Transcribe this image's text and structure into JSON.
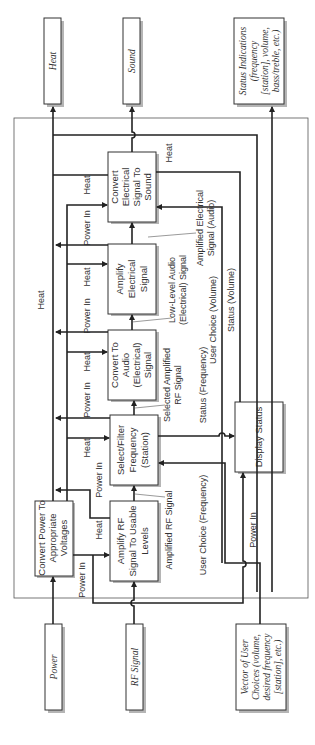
{
  "diagram": {
    "orientation": "rotated-90-ccw",
    "external_outputs": [
      {
        "id": "heat",
        "label": "Heat"
      },
      {
        "id": "sound",
        "label": "Sound"
      },
      {
        "id": "status",
        "lines": [
          "Status Indications",
          "(frequency",
          "[station], volume,",
          "bass/treble, etc.)"
        ]
      }
    ],
    "external_inputs": [
      {
        "id": "power",
        "label": "Power"
      },
      {
        "id": "rf",
        "label": "RF Signal"
      },
      {
        "id": "choices",
        "lines": [
          "Vector of User",
          "Choices (volume,",
          "desired frequency",
          "[station], etc.)"
        ]
      }
    ],
    "functions": [
      {
        "id": "convert-power",
        "lines": [
          "Convert Power To",
          "Appropriate",
          "Voltages"
        ]
      },
      {
        "id": "amplify-rf",
        "lines": [
          "Amplify RF",
          "Signal To Usable",
          "Levels"
        ]
      },
      {
        "id": "select-filter",
        "lines": [
          "Select/Filter",
          "Frequency",
          "(Station)"
        ]
      },
      {
        "id": "convert-audio",
        "lines": [
          "Convert To",
          "Audio",
          "(Electrical)",
          "Signal"
        ]
      },
      {
        "id": "amplify-electrical",
        "lines": [
          "Amplify",
          "Electrical",
          "Signal"
        ]
      },
      {
        "id": "convert-sound",
        "lines": [
          "Convert",
          "Electrical",
          "Signal To",
          "Sound"
        ]
      },
      {
        "id": "display-status",
        "lines": [
          "Display Status"
        ]
      }
    ],
    "flows": {
      "heat": "Heat",
      "power_in": "Power In",
      "amplified_rf": "Amplified RF Signal",
      "selected_rf": [
        "Selected Amplified",
        "RF Signal"
      ],
      "low_level_audio": [
        "Low-Level Audio",
        "(Electrical) Signal"
      ],
      "amplified_audio": [
        "Amplified Electrical",
        "Signal (Audio)"
      ],
      "user_choice_freq": "User Choice (Frequency)",
      "user_choice_vol": "User Choice (Volume)",
      "status_freq": "Status (Frequency)",
      "status_vol": "Status (Volume)"
    }
  }
}
